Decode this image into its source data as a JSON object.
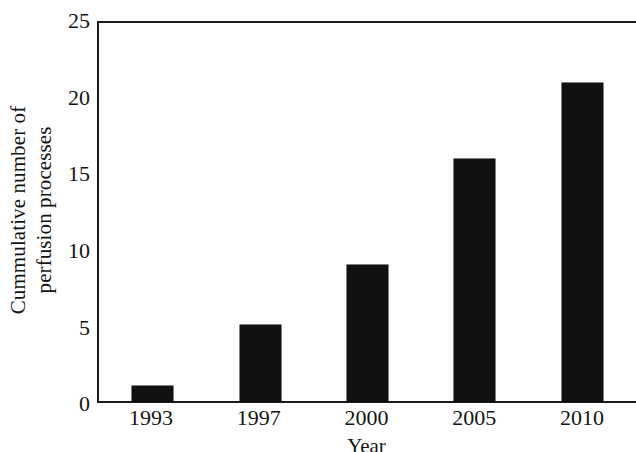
{
  "chart_data": {
    "type": "bar",
    "title": "",
    "subtitle": "",
    "categories": [
      "1993",
      "1997",
      "2000",
      "2005",
      "2010"
    ],
    "values": [
      1,
      5,
      9,
      16,
      21
    ],
    "xlabel": "Year",
    "ylabel_line1": "Cummulative number of",
    "ylabel_line2": "perfusion processes",
    "ylabel": "Cummulative number of perfusion processes",
    "ylim": [
      0,
      25
    ],
    "yticks": [
      25,
      20,
      15,
      10,
      5,
      0
    ],
    "ytick_labels": [
      "25",
      "20",
      "15",
      "10",
      "5",
      "0"
    ],
    "grid": false,
    "legend": null,
    "legend_position": "none",
    "bar_color": "#111111",
    "axis_color": "#1a1a1a",
    "background_color": "#ffffff",
    "annotations": []
  }
}
